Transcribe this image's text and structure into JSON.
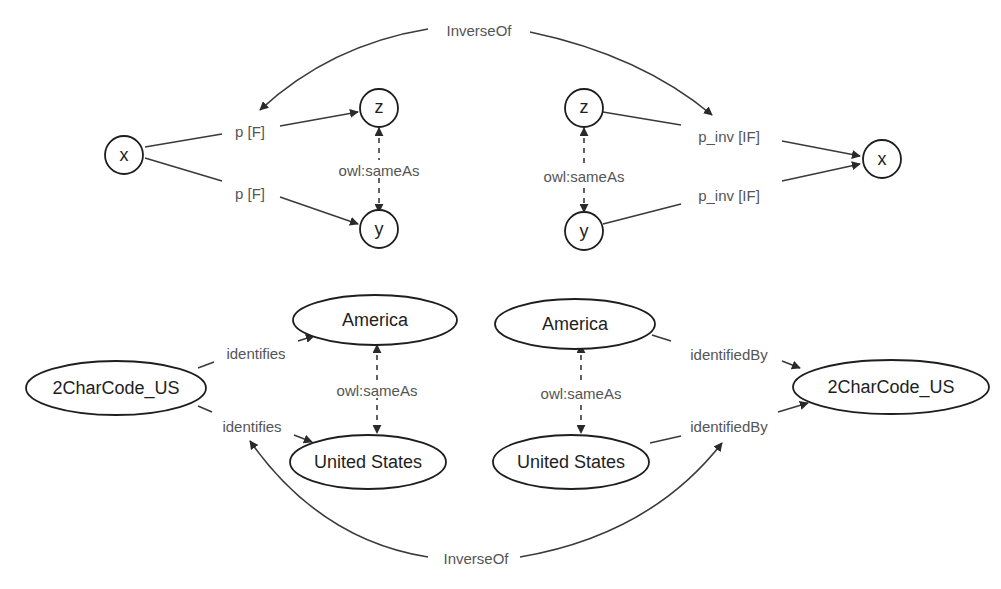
{
  "diagram": {
    "top_left": {
      "nodes": {
        "x": "x",
        "z": "z",
        "y": "y"
      },
      "edges": {
        "x_to_z": "p [F]",
        "x_to_y": "p [F]",
        "same_as": "owl:sameAs"
      }
    },
    "top_right": {
      "nodes": {
        "z": "z",
        "y": "y",
        "x": "x"
      },
      "edges": {
        "z_to_x": "p_inv [IF]",
        "y_to_x": "p_inv [IF]",
        "same_as": "owl:sameAs"
      }
    },
    "top_inverse_label": "InverseOf",
    "bottom_left": {
      "nodes": {
        "code": "2CharCode_US",
        "america": "America",
        "united_states": "United States"
      },
      "edges": {
        "code_to_america": "identifies",
        "code_to_us": "identifies",
        "same_as": "owl:sameAs"
      }
    },
    "bottom_right": {
      "nodes": {
        "america": "America",
        "united_states": "United States",
        "code": "2CharCode_US"
      },
      "edges": {
        "america_to_code": "identifiedBy",
        "us_to_code": "identifiedBy",
        "same_as": "owl:sameAs"
      }
    },
    "bottom_inverse_label": "InverseOf"
  }
}
